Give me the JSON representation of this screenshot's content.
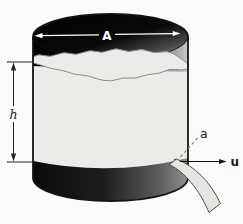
{
  "diagram": {
    "labels": {
      "tank_top_area": "A",
      "liquid_height": "h",
      "orifice_area": "a",
      "outflow_speed": "u"
    },
    "colors": {
      "background": "#fbfbf9",
      "liquid": "#eaece7",
      "tank_dark": "#0a0a0a",
      "outline": "#151515",
      "wavy_line": "#8a8a8a",
      "leader_dash": "#777777",
      "stream_fill": "#e3e5e1",
      "stream_stroke": "#4f4f4f",
      "label_light": "#ffffff",
      "label_dark": "#1a1a1a"
    }
  }
}
